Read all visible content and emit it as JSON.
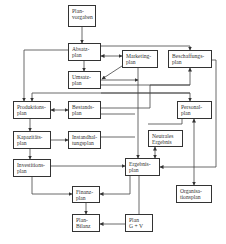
{
  "diagram": {
    "type": "flowchart",
    "nodes": [
      {
        "id": "planvorgaben",
        "label": "Plan-\nvorgaben"
      },
      {
        "id": "absatzplan",
        "label": "Absatz-\nplan"
      },
      {
        "id": "umsatzplan",
        "label": "Umsatz-\nplan"
      },
      {
        "id": "marketingplan",
        "label": "Marketing-\nplan"
      },
      {
        "id": "beschaffungsplan",
        "label": "Beschaffungs-\nplan"
      },
      {
        "id": "produktionsplan",
        "label": "Produktions-\nplan"
      },
      {
        "id": "bestandsplan",
        "label": "Bestands-\nplan"
      },
      {
        "id": "personalplan",
        "label": "Personal-\nplan"
      },
      {
        "id": "kapazitaetsplan",
        "label": "Kapazitäts-\nplan"
      },
      {
        "id": "instandhaltungsplan",
        "label": "Instandhal-\ntungsplan"
      },
      {
        "id": "neutrales_ergebnis",
        "label": "Neutrales\nErgebnis"
      },
      {
        "id": "investitionsplan",
        "label": "Investitions-\nplan"
      },
      {
        "id": "ergebnisplan",
        "label": "Ergebnis-\nplan"
      },
      {
        "id": "organisationsplan",
        "label": "Organisa-\ntionsplan"
      },
      {
        "id": "finanzplan",
        "label": "Finanz-\nplan"
      },
      {
        "id": "planbilanz",
        "label": "Plan-\nBilanz"
      },
      {
        "id": "plan_guv",
        "label": "Plan\nG + V"
      }
    ],
    "edges": [
      {
        "from": "planvorgaben",
        "to": "absatzplan"
      },
      {
        "from": "absatzplan",
        "to": "umsatzplan"
      },
      {
        "from": "absatzplan",
        "to": "marketingplan",
        "bidirectional": true
      },
      {
        "from": "marketingplan",
        "to": "umsatzplan"
      },
      {
        "from": "absatzplan",
        "to": "produktionsplan"
      },
      {
        "from": "absatzplan",
        "to": "beschaffungsplan"
      },
      {
        "from": "produktionsplan",
        "to": "bestandsplan",
        "bidirectional": true
      },
      {
        "from": "produktionsplan",
        "to": "kapazitaetsplan"
      },
      {
        "from": "kapazitaetsplan",
        "to": "instandhaltungsplan"
      },
      {
        "from": "kapazitaetsplan",
        "to": "investitionsplan"
      },
      {
        "from": "umsatzplan",
        "to": "ergebnisplan"
      },
      {
        "from": "marketingplan",
        "to": "ergebnisplan"
      },
      {
        "from": "bestandsplan",
        "to": "ergebnisplan"
      },
      {
        "from": "instandhaltungsplan",
        "to": "ergebnisplan"
      },
      {
        "from": "investitionsplan",
        "to": "ergebnisplan"
      },
      {
        "from": "neutrales_ergebnis",
        "to": "ergebnisplan",
        "bidirectional": true
      },
      {
        "from": "personalplan",
        "to": "organisationsplan",
        "bidirectional": true
      },
      {
        "from": "beschaffungsplan",
        "to": "ergebnisplan"
      },
      {
        "from": "investitionsplan",
        "to": "finanzplan"
      },
      {
        "from": "ergebnisplan",
        "to": "finanzplan"
      },
      {
        "from": "finanzplan",
        "to": "planbilanz"
      },
      {
        "from": "plan_guv",
        "to": "planbilanz"
      },
      {
        "from": "ergebnisplan",
        "to": "plan_guv"
      }
    ]
  },
  "colors": {
    "line": "#333333",
    "box_border": "#333333",
    "background": "#ffffff"
  }
}
